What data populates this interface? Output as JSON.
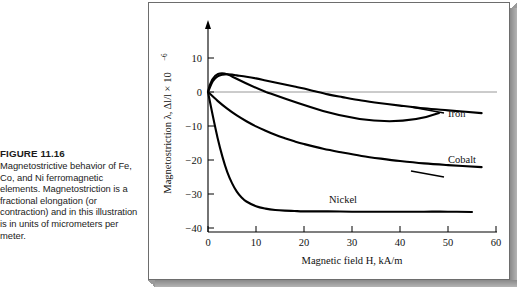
{
  "caption": {
    "figure_number": "FIGURE 11.16",
    "text": "Magnetostrictive behavior of Fe, Co, and Ni ferromagnetic elements. Magnetostriction is a fractional elongation (or contraction) and in this illustration is in units of micrometers per meter."
  },
  "chart_data": {
    "type": "line",
    "title": "",
    "xlabel": "Magnetic field H, kA/m",
    "ylabel": "Magnetostriction λ, Δl/l × 10",
    "ylabel_exponent": "−6",
    "xlim": [
      0,
      60
    ],
    "ylim": [
      -40,
      14
    ],
    "xticks": [
      0,
      10,
      20,
      30,
      40,
      50,
      60
    ],
    "yticks": [
      10,
      0,
      -10,
      -20,
      -30,
      -40
    ],
    "xticklabels": [
      "0",
      "10",
      "20",
      "30",
      "40",
      "50",
      "60"
    ],
    "yticklabels": [
      "10",
      "0",
      "−10",
      "−20",
      "−30",
      "−40"
    ],
    "grid": false,
    "zero_reference_line": true,
    "legend_position": "inline-labels",
    "series": [
      {
        "name": "Iron",
        "label": "Iron",
        "color": "#000000",
        "x": [
          0,
          1,
          2,
          3,
          4,
          5,
          6,
          8,
          10,
          12,
          14,
          16,
          18,
          20,
          22,
          25,
          28,
          32,
          36,
          40,
          45,
          50,
          57
        ],
        "values": [
          0,
          3.2,
          4.6,
          5.1,
          5.2,
          5.1,
          4.9,
          4.5,
          4.0,
          3.4,
          2.8,
          2.2,
          1.6,
          1.0,
          0.3,
          -0.7,
          -1.5,
          -2.5,
          -3.3,
          -4.0,
          -4.8,
          -5.4,
          -6.2
        ]
      },
      {
        "name": "Cobalt",
        "label": "Cobalt",
        "color": "#000000",
        "x": [
          0,
          2,
          4,
          6,
          8,
          10,
          12,
          14,
          16,
          18,
          20,
          24,
          28,
          32,
          36,
          40,
          45,
          50,
          57
        ],
        "values": [
          0,
          -2.6,
          -4.9,
          -6.9,
          -8.6,
          -10.1,
          -11.4,
          -12.6,
          -13.6,
          -14.5,
          -15.3,
          -16.7,
          -17.8,
          -18.8,
          -19.6,
          -20.3,
          -21.0,
          -21.5,
          -22.1
        ]
      },
      {
        "name": "Nickel",
        "label": "Nickel",
        "color": "#000000",
        "x": [
          0,
          1,
          2,
          3,
          4,
          5,
          6,
          7,
          8,
          10,
          12,
          14,
          16,
          18,
          20,
          25,
          30,
          35,
          40,
          45,
          50,
          55
        ],
        "values": [
          0,
          -7.0,
          -13.5,
          -19.0,
          -23.5,
          -26.8,
          -29.3,
          -31.0,
          -32.2,
          -33.6,
          -34.3,
          -34.7,
          -34.9,
          -35.0,
          -35.1,
          -35.1,
          -35.2,
          -35.2,
          -35.2,
          -35.2,
          -35.2,
          -35.3
        ]
      }
    ],
    "annotations": [
      {
        "text": "Iron",
        "target_series": "Iron"
      },
      {
        "text": "Cobalt",
        "target_series": "Cobalt"
      },
      {
        "text": "Nickel",
        "target_series": "Nickel"
      }
    ]
  }
}
